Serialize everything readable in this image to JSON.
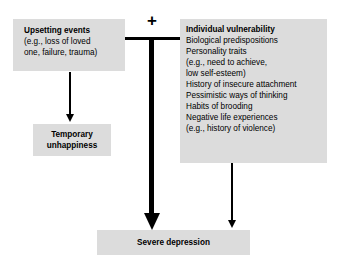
{
  "diagram": {
    "type": "flowchart",
    "title": "",
    "operator_symbol": "+",
    "colors": {
      "box_fill": "#dcdcdc",
      "line": "#000000",
      "text": "#000000",
      "background": "#ffffff"
    },
    "nodes": {
      "upsetting_events": {
        "title": "Upsetting events",
        "lines": [
          "(e.g., loss of loved",
          "one, failure, trauma)"
        ]
      },
      "temporary_unhappiness": {
        "line1": "Temporary",
        "line2": "unhappiness"
      },
      "individual_vulnerability": {
        "title": "Individual vulnerability",
        "lines": [
          "Biological predispositions",
          "Personality traits",
          "(e.g., need to achieve,",
          "low self-esteem)",
          "History of insecure attachment",
          "Pessimistic ways of thinking",
          "Habits of brooding",
          "Negative life experiences",
          "(e.g., history of violence)"
        ]
      },
      "severe_depression": {
        "title": "Severe depression"
      }
    }
  }
}
